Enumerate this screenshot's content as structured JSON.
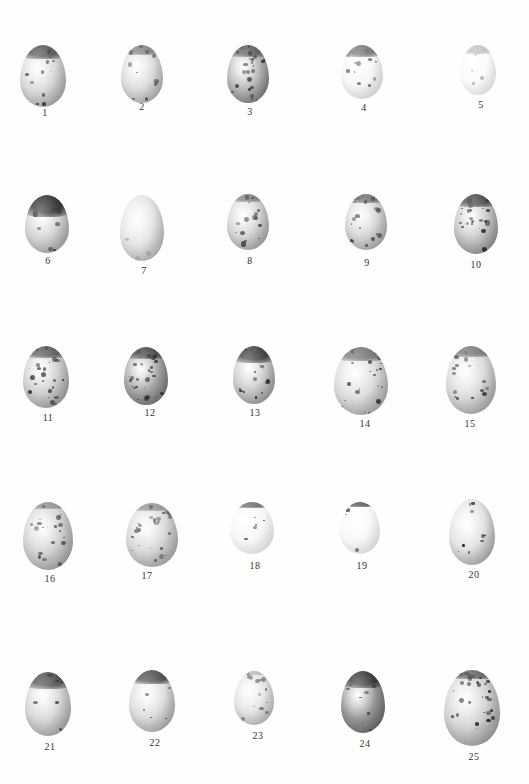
{
  "plate": {
    "background": "#ffffff",
    "label_color": "#333333",
    "eggs": [
      {
        "label": "1",
        "cx": 43,
        "cy": 76,
        "w": 46,
        "h": 62,
        "tone": "#d8d8d8",
        "shadow": "#8a8a8a",
        "cap": "#4a4a4a",
        "cap_h": 0.22,
        "speckle": "#3a3a3a",
        "density": 14,
        "opacity": 1,
        "label_x": 45,
        "label_y": 114
      },
      {
        "label": "2",
        "cx": 142,
        "cy": 74,
        "w": 42,
        "h": 58,
        "tone": "#dcdcdc",
        "shadow": "#9a9a9a",
        "cap": "#7a7a7a",
        "cap_h": 0.18,
        "speckle": "#555555",
        "density": 10,
        "opacity": 1,
        "label_x": 142,
        "label_y": 108
      },
      {
        "label": "3",
        "cx": 248,
        "cy": 74,
        "w": 42,
        "h": 58,
        "tone": "#b8b8b8",
        "shadow": "#5a5a5a",
        "cap": "#555555",
        "cap_h": 0.2,
        "speckle": "#2f2f2f",
        "density": 26,
        "opacity": 1,
        "label_x": 250,
        "label_y": 113
      },
      {
        "label": "4",
        "cx": 362,
        "cy": 72,
        "w": 42,
        "h": 54,
        "tone": "#f6f6f6",
        "shadow": "#dcdcdc",
        "cap": "#6a6a6a",
        "cap_h": 0.22,
        "speckle": "#6a6a6a",
        "density": 12,
        "opacity": 1,
        "label_x": 364,
        "label_y": 109
      },
      {
        "label": "5",
        "cx": 478,
        "cy": 70,
        "w": 36,
        "h": 50,
        "tone": "#fafafa",
        "shadow": "#ececec",
        "cap": "#bdbdbd",
        "cap_h": 0.18,
        "speckle": "#bcbcbc",
        "density": 6,
        "opacity": 1,
        "label_x": 481,
        "label_y": 106
      },
      {
        "label": "6",
        "cx": 47,
        "cy": 224,
        "w": 44,
        "h": 58,
        "tone": "#d4d4d4",
        "shadow": "#8c8c8c",
        "cap": "#1e1e1e",
        "cap_h": 0.38,
        "speckle": "#333333",
        "density": 8,
        "opacity": 1,
        "label_x": 48,
        "label_y": 262
      },
      {
        "label": "7",
        "cx": 142,
        "cy": 228,
        "w": 44,
        "h": 66,
        "tone": "#e4e4e4",
        "shadow": "#a0a0a0",
        "cap": "#e9e9e9",
        "cap_h": 0.0,
        "speckle": "#b0b0b0",
        "density": 5,
        "opacity": 1,
        "label_x": 144,
        "label_y": 272
      },
      {
        "label": "8",
        "cx": 248,
        "cy": 222,
        "w": 42,
        "h": 56,
        "tone": "#d4d4d4",
        "shadow": "#8a8a8a",
        "cap": "#7a7a7a",
        "cap_h": 0.14,
        "speckle": "#3f3f3f",
        "density": 18,
        "opacity": 1,
        "label_x": 250,
        "label_y": 262
      },
      {
        "label": "9",
        "cx": 366,
        "cy": 222,
        "w": 42,
        "h": 56,
        "tone": "#d6d6d6",
        "shadow": "#8e8e8e",
        "cap": "#6a6a6a",
        "cap_h": 0.16,
        "speckle": "#454545",
        "density": 20,
        "opacity": 1,
        "label_x": 367,
        "label_y": 264
      },
      {
        "label": "10",
        "cx": 476,
        "cy": 224,
        "w": 44,
        "h": 60,
        "tone": "#c6c6c6",
        "shadow": "#707070",
        "cap": "#3e3e3e",
        "cap_h": 0.22,
        "speckle": "#333333",
        "density": 22,
        "opacity": 1,
        "label_x": 476,
        "label_y": 266
      },
      {
        "label": "11",
        "cx": 46,
        "cy": 377,
        "w": 46,
        "h": 62,
        "tone": "#cfcfcf",
        "shadow": "#808080",
        "cap": "#4c4c4c",
        "cap_h": 0.2,
        "speckle": "#2f2f2f",
        "density": 24,
        "opacity": 1,
        "label_x": 48,
        "label_y": 419
      },
      {
        "label": "12",
        "cx": 146,
        "cy": 376,
        "w": 44,
        "h": 58,
        "tone": "#a8a8a8",
        "shadow": "#555555",
        "cap": "#404040",
        "cap_h": 0.2,
        "speckle": "#2a2a2a",
        "density": 28,
        "opacity": 1,
        "label_x": 150,
        "label_y": 414
      },
      {
        "label": "13",
        "cx": 254,
        "cy": 375,
        "w": 42,
        "h": 58,
        "tone": "#cccccc",
        "shadow": "#7a7a7a",
        "cap": "#2e2e2e",
        "cap_h": 0.3,
        "speckle": "#333333",
        "density": 18,
        "opacity": 1,
        "label_x": 255,
        "label_y": 414
      },
      {
        "label": "14",
        "cx": 361,
        "cy": 381,
        "w": 54,
        "h": 68,
        "tone": "#dcdcdc",
        "shadow": "#8e8e8e",
        "cap": "#6a6a6a",
        "cap_h": 0.2,
        "speckle": "#454545",
        "density": 24,
        "opacity": 1,
        "label_x": 365,
        "label_y": 425
      },
      {
        "label": "15",
        "cx": 471,
        "cy": 380,
        "w": 50,
        "h": 68,
        "tone": "#dadada",
        "shadow": "#8a8a8a",
        "cap": "#6e6e6e",
        "cap_h": 0.16,
        "speckle": "#4a4a4a",
        "density": 22,
        "opacity": 1,
        "label_x": 470,
        "label_y": 425
      },
      {
        "label": "16",
        "cx": 48,
        "cy": 536,
        "w": 50,
        "h": 68,
        "tone": "#d2d2d2",
        "shadow": "#868686",
        "cap": "#8a8a8a",
        "cap_h": 0.1,
        "speckle": "#555555",
        "density": 26,
        "opacity": 1,
        "label_x": 50,
        "label_y": 580
      },
      {
        "label": "17",
        "cx": 152,
        "cy": 535,
        "w": 52,
        "h": 64,
        "tone": "#d8d8d8",
        "shadow": "#8e8e8e",
        "cap": "#8e8e8e",
        "cap_h": 0.12,
        "speckle": "#555555",
        "density": 24,
        "opacity": 1,
        "label_x": 147,
        "label_y": 577
      },
      {
        "label": "18",
        "cx": 252,
        "cy": 528,
        "w": 44,
        "h": 52,
        "tone": "#f7f7f7",
        "shadow": "#e6e6e6",
        "cap": "#5e5e5e",
        "cap_h": 0.12,
        "speckle": "#5a5a5a",
        "density": 6,
        "opacity": 1,
        "label_x": 255,
        "label_y": 567
      },
      {
        "label": "19",
        "cx": 360,
        "cy": 528,
        "w": 40,
        "h": 52,
        "tone": "#f8f8f8",
        "shadow": "#e8e8e8",
        "cap": "#4a4a4a",
        "cap_h": 0.1,
        "speckle": "#4a4a4a",
        "density": 4,
        "opacity": 1,
        "label_x": 362,
        "label_y": 567
      },
      {
        "label": "20",
        "cx": 472,
        "cy": 532,
        "w": 46,
        "h": 66,
        "tone": "#e2e2e2",
        "shadow": "#8a8a8a",
        "cap": "#f0f0f0",
        "cap_h": 0.0,
        "speckle": "#1e1e1e",
        "density": 10,
        "opacity": 1,
        "label_x": 474,
        "label_y": 576
      },
      {
        "label": "21",
        "cx": 48,
        "cy": 704,
        "w": 46,
        "h": 64,
        "tone": "#d6d6d6",
        "shadow": "#8a8a8a",
        "cap": "#3e3e3e",
        "cap_h": 0.26,
        "speckle": "#333333",
        "density": 12,
        "opacity": 1,
        "label_x": 50,
        "label_y": 748
      },
      {
        "label": "22",
        "cx": 152,
        "cy": 701,
        "w": 46,
        "h": 62,
        "tone": "#dedede",
        "shadow": "#8e8e8e",
        "cap": "#3c3c3c",
        "cap_h": 0.22,
        "speckle": "#3a3a3a",
        "density": 8,
        "opacity": 1,
        "label_x": 155,
        "label_y": 744
      },
      {
        "label": "23",
        "cx": 254,
        "cy": 698,
        "w": 40,
        "h": 54,
        "tone": "#e4e4e4",
        "shadow": "#a4a4a4",
        "cap": "#b4b4b4",
        "cap_h": 0.08,
        "speckle": "#7a7a7a",
        "density": 14,
        "opacity": 1,
        "label_x": 258,
        "label_y": 737
      },
      {
        "label": "24",
        "cx": 363,
        "cy": 702,
        "w": 44,
        "h": 62,
        "tone": "#9a9a9a",
        "shadow": "#4a4a4a",
        "cap": "#303030",
        "cap_h": 0.28,
        "speckle": "#3a3a3a",
        "density": 14,
        "opacity": 1,
        "label_x": 365,
        "label_y": 745
      },
      {
        "label": "25",
        "cx": 472,
        "cy": 708,
        "w": 56,
        "h": 76,
        "tone": "#d2d2d2",
        "shadow": "#7e7e7e",
        "cap": "#5a5a5a",
        "cap_h": 0.12,
        "speckle": "#2e2e2e",
        "density": 32,
        "opacity": 1,
        "label_x": 474,
        "label_y": 758
      }
    ]
  }
}
